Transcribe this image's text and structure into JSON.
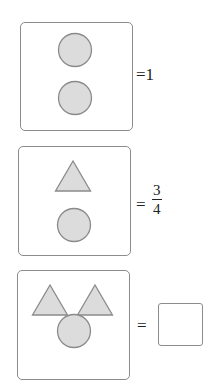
{
  "colors": {
    "shape_fill": "#dcdcdc",
    "shape_stroke": "#8a8a8a",
    "border": "#8c8c8c"
  },
  "rows": [
    {
      "shapes": [
        "circle",
        "circle"
      ],
      "equals": "=",
      "value": "1"
    },
    {
      "shapes": [
        "triangle",
        "circle"
      ],
      "equals": "=",
      "value": {
        "numerator": "3",
        "denominator": "4"
      }
    },
    {
      "shapes": [
        "triangle",
        "triangle",
        "circle"
      ],
      "equals": "=",
      "value": ""
    }
  ]
}
